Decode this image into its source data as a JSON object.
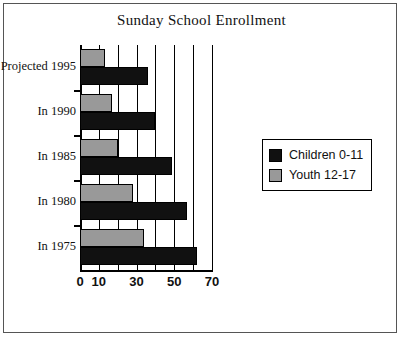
{
  "chart_data": {
    "type": "bar",
    "orientation": "horizontal",
    "title": "Sunday School Enrollment",
    "xlabel": "",
    "ylabel": "",
    "categories": [
      "Projected 1995",
      "In  1990",
      "In  1985",
      "In  1980",
      "In  1975"
    ],
    "series": [
      {
        "name": "Children  0-11",
        "color": "#111111",
        "values": [
          36,
          40,
          49,
          57,
          62
        ]
      },
      {
        "name": "Youth 12-17",
        "color": "#999999",
        "values": [
          13,
          17,
          20,
          28,
          34
        ]
      }
    ],
    "xlim": [
      0,
      70
    ],
    "xticks": [
      0,
      10,
      20,
      30,
      40,
      50,
      60,
      70
    ],
    "xtick_labels": [
      "0",
      "10",
      "",
      "30",
      "",
      "50",
      "",
      "70"
    ],
    "grid": true,
    "legend_position": "right",
    "legend_entries": [
      "Children  0-11",
      "Youth 12-17"
    ]
  },
  "legend": {
    "children_label": "Children  0-11",
    "youth_label": "Youth 12-17"
  },
  "colors": {
    "children": "#111111",
    "youth": "#999999",
    "axis": "#000000",
    "frame": "#555555",
    "background": "#ffffff"
  }
}
